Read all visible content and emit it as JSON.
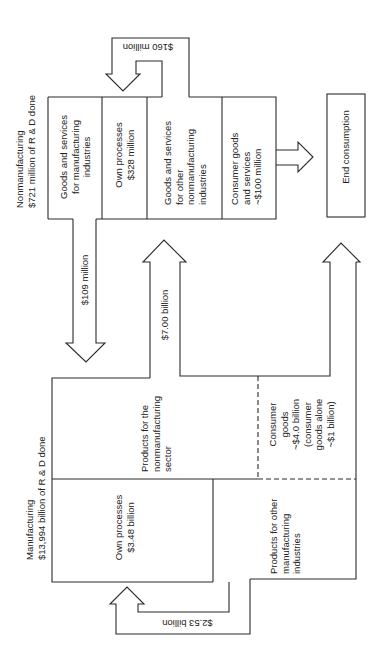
{
  "nonmanufacturing": {
    "header_line1": "Nonmanufacturing",
    "header_line2": "$721 million of R & D done",
    "boxes": [
      {
        "lines": [
          "Goods and services",
          "for manufacturing",
          "industries"
        ]
      },
      {
        "lines": [
          "Own processes",
          "$328 million"
        ]
      },
      {
        "lines": [
          "Goods and services",
          "for other",
          "nonmanufacturing",
          "industries"
        ]
      },
      {
        "lines": [
          "Consumer goods",
          "and services",
          "~$100 million"
        ]
      }
    ],
    "loop_flow": "$160 million"
  },
  "end_consumption": {
    "label": "End consumption"
  },
  "manufacturing": {
    "header_line1": "Manufacturing",
    "header_line2": "$13,994 billion of R & D done",
    "boxes": [
      {
        "lines": [
          "Products for the",
          "nonmanufacturing",
          "sector"
        ]
      },
      {
        "lines": [
          "Consumer",
          "goods",
          "~$4.0 billion",
          "(consumer",
          "goods alone",
          "~$1 billion)"
        ]
      },
      {
        "lines": [
          "Own processes",
          "$3.48 billion"
        ]
      },
      {
        "lines": [
          "Products for other",
          "manufacturing",
          "industries"
        ]
      }
    ],
    "loop_flow": "$2.53 billion"
  },
  "flows": {
    "nonmfg_to_mfg": "$109 million",
    "mfg_to_nonmfg": "$7.00 billion"
  },
  "colors": {
    "stroke": "#2a2a2a",
    "background": "#ffffff"
  }
}
